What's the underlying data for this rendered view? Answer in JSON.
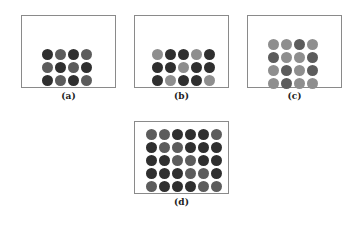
{
  "colors": {
    "D": "#2f2f2f",
    "M": "#5c5c5c",
    "L": "#8e8e8e",
    "frame": "#8a8a8a"
  },
  "panels": [
    {
      "id": "a",
      "label": "(a)",
      "frame": {
        "x": 21,
        "y": 15,
        "w": 95,
        "h": 73
      },
      "grid_origin": {
        "x": 42,
        "y": 49
      },
      "rows": [
        [
          "D",
          "M",
          "D",
          "M"
        ],
        [
          "M",
          "D",
          "M",
          "D"
        ],
        [
          "D",
          "M",
          "D",
          "M"
        ]
      ]
    },
    {
      "id": "b",
      "label": "(b)",
      "frame": {
        "x": 134,
        "y": 15,
        "w": 95,
        "h": 73
      },
      "grid_origin": {
        "x": 152,
        "y": 49
      },
      "rows": [
        [
          "L",
          "D",
          "D",
          "L",
          "D"
        ],
        [
          "D",
          "D",
          "L",
          "D",
          "D"
        ],
        [
          "D",
          "L",
          "D",
          "D",
          "L"
        ]
      ]
    },
    {
      "id": "c",
      "label": "(c)",
      "frame": {
        "x": 247,
        "y": 15,
        "w": 95,
        "h": 73
      },
      "grid_origin": {
        "x": 268,
        "y": 39
      },
      "rows": [
        [
          "L",
          "L",
          "M",
          "L"
        ],
        [
          "M",
          "L",
          "L",
          "M"
        ],
        [
          "L",
          "M",
          "L",
          "M"
        ],
        [
          "L",
          "M",
          "L",
          "L"
        ]
      ]
    },
    {
      "id": "d",
      "label": "(d)",
      "frame": {
        "x": 134,
        "y": 121,
        "w": 95,
        "h": 73
      },
      "grid_origin": {
        "x": 146,
        "y": 129
      },
      "rows": [
        [
          "M",
          "M",
          "D",
          "D",
          "D",
          "M"
        ],
        [
          "D",
          "M",
          "M",
          "D",
          "D",
          "D"
        ],
        [
          "D",
          "D",
          "M",
          "M",
          "D",
          "D"
        ],
        [
          "D",
          "D",
          "D",
          "M",
          "M",
          "D"
        ],
        [
          "M",
          "D",
          "D",
          "D",
          "M",
          "M"
        ]
      ]
    }
  ],
  "dot_size": 11,
  "dot_gap": 2
}
